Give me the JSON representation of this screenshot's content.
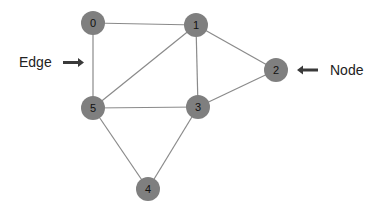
{
  "diagram": {
    "type": "undirected-graph",
    "node_color": "#7f7f7f",
    "edge_color": "#8a8a8a",
    "nodes": [
      {
        "id": "0",
        "label": "0",
        "x": 93,
        "y": 23
      },
      {
        "id": "1",
        "label": "1",
        "x": 196,
        "y": 25
      },
      {
        "id": "2",
        "label": "2",
        "x": 276,
        "y": 70
      },
      {
        "id": "3",
        "label": "3",
        "x": 198,
        "y": 107
      },
      {
        "id": "4",
        "label": "4",
        "x": 148,
        "y": 189
      },
      {
        "id": "5",
        "label": "5",
        "x": 93,
        "y": 108
      }
    ],
    "edges": [
      {
        "from": "0",
        "to": "1"
      },
      {
        "from": "0",
        "to": "5"
      },
      {
        "from": "1",
        "to": "5"
      },
      {
        "from": "1",
        "to": "3"
      },
      {
        "from": "1",
        "to": "2"
      },
      {
        "from": "2",
        "to": "3"
      },
      {
        "from": "5",
        "to": "3"
      },
      {
        "from": "5",
        "to": "4"
      },
      {
        "from": "3",
        "to": "4"
      }
    ],
    "annotations": {
      "edge_callout": {
        "label": "Edge",
        "arrow_direction": "right"
      },
      "node_callout": {
        "label": "Node",
        "arrow_direction": "left"
      }
    }
  }
}
